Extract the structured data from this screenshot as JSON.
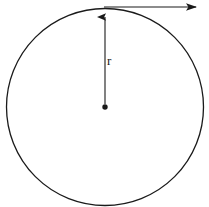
{
  "figure": {
    "type": "geometry-diagram",
    "background_color": "#ffffff",
    "stroke_color": "#1a1a1a",
    "width": 209,
    "height": 207
  },
  "circle": {
    "name": "circle-outline",
    "center_x": 105,
    "center_y": 107,
    "radius_x": 99,
    "radius_y": 99,
    "stroke_width": 1.3,
    "fill": "none"
  },
  "center_point": {
    "name": "center-dot",
    "x": 105,
    "y": 107,
    "radius": 2.6,
    "fill": "#1a1a1a"
  },
  "radius_arrow": {
    "name": "radius-arrow",
    "from_x": 105,
    "from_y": 107,
    "to_x": 105,
    "to_y": 10,
    "label": "r",
    "label_x": 107,
    "label_y": 54,
    "stroke_width": 1.1
  },
  "top_arrow": {
    "name": "tangent-arrow",
    "from_x": 105,
    "from_y": 7,
    "to_x": 206,
    "to_y": 7,
    "stroke_width": 1.2,
    "label": "···",
    "label_note": "truncated-at-image-edge"
  },
  "labels": {
    "radius": "r",
    "top_truncated": "···"
  }
}
